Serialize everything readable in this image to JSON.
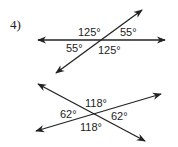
{
  "problem": {
    "number_label": "4)"
  },
  "figure_top": {
    "angles": {
      "upper_left": "125°",
      "upper_right": "55°",
      "lower_left": "55°",
      "lower_right": "125°"
    }
  },
  "figure_bottom": {
    "angles": {
      "top": "118°",
      "left": "62°",
      "right": "62°",
      "bottom": "118°"
    }
  },
  "colors": {
    "line": "#222222",
    "background": "#ffffff"
  }
}
